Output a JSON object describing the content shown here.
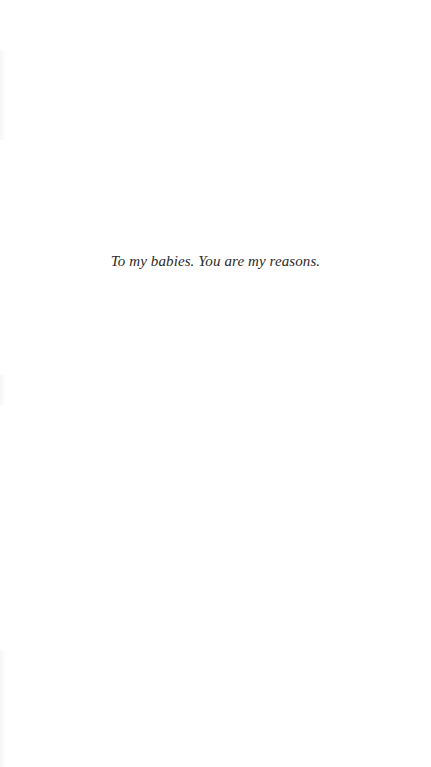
{
  "page": {
    "type": "dedication",
    "text": "To my babies. You are my reasons."
  },
  "colors": {
    "background": "#ffffff",
    "text": "#2a2a2a"
  }
}
